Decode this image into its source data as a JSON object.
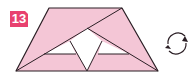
{
  "step": {
    "number": "13",
    "badge_color": "#e8416f"
  },
  "diagram": {
    "paper_color": "#f4c6d6",
    "line_color": "#2a1e24",
    "white_flap_color": "#ffffff",
    "shape": "trapezoid",
    "icon": "turn-over-icon"
  }
}
